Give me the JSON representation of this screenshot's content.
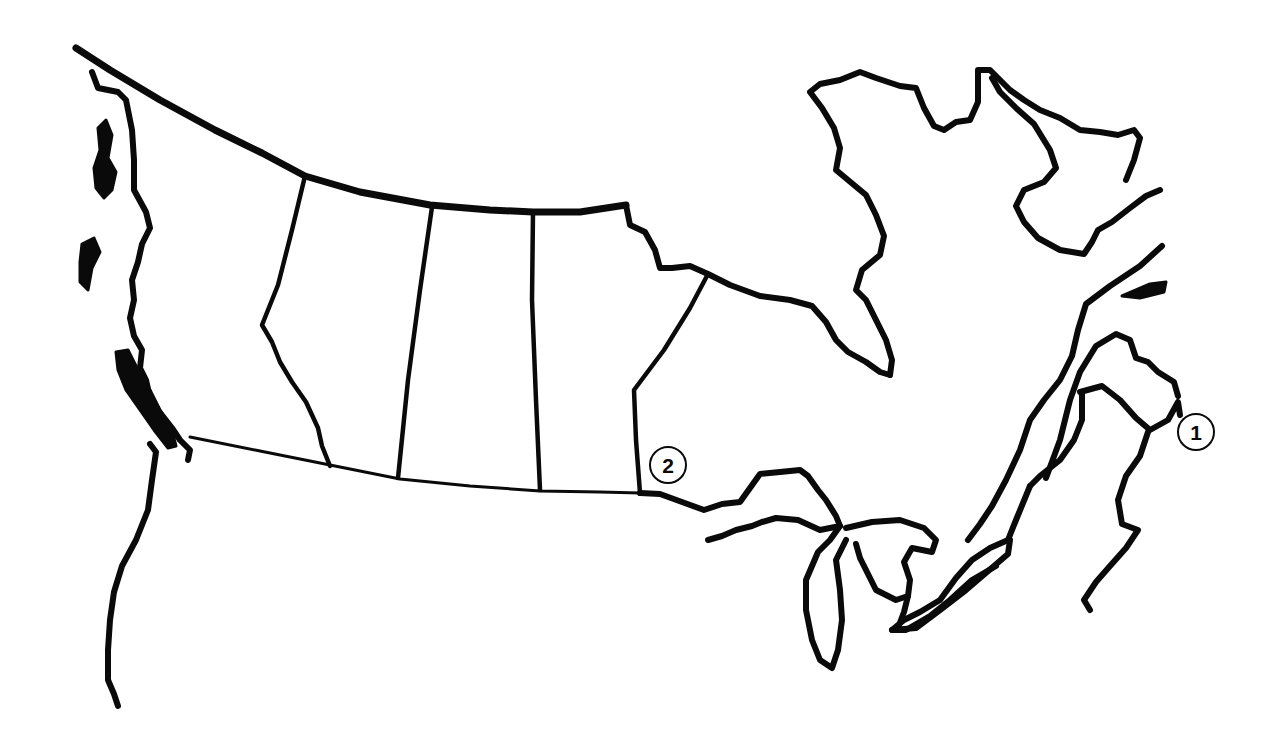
{
  "map": {
    "subject": "Outline map of southern Canada",
    "style": "black line art on white",
    "colors": {
      "background": "#ffffff",
      "ink": "#0a0a0a"
    },
    "regions_depicted": [
      "British Columbia coast",
      "Alberta",
      "Saskatchewan",
      "Manitoba",
      "Ontario",
      "Hudson Bay / James Bay",
      "Ungava / Quebec north coast",
      "Great Lakes",
      "St. Lawrence River",
      "Maritimes"
    ],
    "markers": [
      {
        "id": "marker-1",
        "label": "1",
        "x": 1196,
        "y": 432
      },
      {
        "id": "marker-2",
        "label": "2",
        "x": 668,
        "y": 465
      }
    ]
  }
}
